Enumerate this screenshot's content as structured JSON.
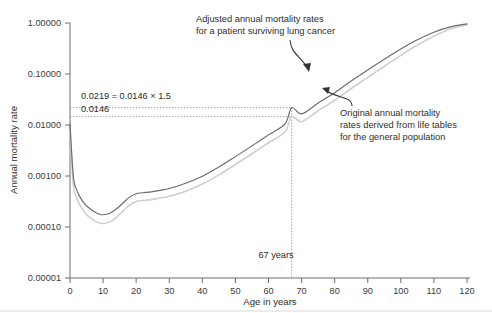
{
  "chart_data": {
    "type": "line",
    "title": "",
    "xlabel": "Age in years",
    "ylabel": "Annual mortality rate",
    "yscale": "log",
    "ylim": [
      1e-05,
      1.0
    ],
    "xlim": [
      0,
      120
    ],
    "grid": false,
    "legend_position": "none",
    "xticks": [
      "0",
      "10",
      "20",
      "30",
      "40",
      "50",
      "60",
      "70",
      "80",
      "90",
      "100",
      "110",
      "120"
    ],
    "xtick_values": [
      0,
      10,
      20,
      30,
      40,
      50,
      60,
      70,
      80,
      90,
      100,
      110,
      120
    ],
    "yticks": [
      "1.00000",
      "0.10000",
      "0.01000",
      "0.00100",
      "0.00010",
      "0.00001"
    ],
    "ytick_values": [
      1.0,
      0.1,
      0.01,
      0.001,
      0.0001,
      1e-05
    ],
    "x": [
      0,
      1,
      2,
      3,
      4,
      5,
      6,
      7,
      8,
      9,
      10,
      12,
      14,
      16,
      18,
      20,
      22,
      25,
      30,
      35,
      40,
      45,
      50,
      55,
      60,
      65,
      67,
      70,
      75,
      80,
      85,
      90,
      95,
      100,
      105,
      110,
      115,
      120
    ],
    "series": [
      {
        "name": "Adjusted annual mortality rates for a patient surviving lung cancer",
        "color": "#6b6b6b",
        "values": [
          0.0106,
          0.00099,
          0.00054,
          0.00039,
          0.00031,
          0.00026,
          0.00023,
          0.000205,
          0.000188,
          0.000178,
          0.000174,
          0.000186,
          0.000225,
          0.000295,
          0.000385,
          0.00045,
          0.00047,
          0.000495,
          0.00057,
          0.00072,
          0.00099,
          0.0015,
          0.0024,
          0.0039,
          0.0064,
          0.0105,
          0.0219,
          0.0165,
          0.027,
          0.043,
          0.073,
          0.12,
          0.195,
          0.31,
          0.47,
          0.66,
          0.84,
          0.96
        ]
      },
      {
        "name": "Original annual mortality rates derived from life tables for the general population",
        "color": "#cfcfcf",
        "values": [
          0.0076,
          0.00068,
          0.00037,
          0.00027,
          0.00021,
          0.000175,
          0.000155,
          0.000138,
          0.000126,
          0.00012,
          0.000117,
          0.000126,
          0.000155,
          0.000205,
          0.000268,
          0.000315,
          0.00033,
          0.000348,
          0.0004,
          0.000505,
          0.000695,
          0.00105,
          0.00168,
          0.00273,
          0.00448,
          0.00735,
          0.0146,
          0.0116,
          0.019,
          0.0305,
          0.052,
          0.086,
          0.142,
          0.232,
          0.37,
          0.55,
          0.76,
          0.92
        ]
      }
    ],
    "annotations": [
      {
        "name": "adjusted-curve-callout",
        "text_lines": [
          "Adjusted annual mortality rates",
          "for a patient surviving lung cancer"
        ],
        "points_to": "adjusted curve near age 72"
      },
      {
        "name": "original-curve-callout",
        "text_lines": [
          "Original annual mortality",
          "rates derived from life tables",
          "for the general population"
        ],
        "points_to": "original curve near age 75"
      },
      {
        "name": "ratio-label",
        "text": "0.0219 = 0.0146 × 1.5",
        "value": 0.0219
      },
      {
        "name": "baseline-label",
        "text": "0.0146",
        "value": 0.0146
      },
      {
        "name": "age-marker-label",
        "text": "67 years",
        "value": 67
      }
    ],
    "guides": {
      "horizontal_values": [
        0.0219,
        0.0146
      ],
      "vertical_value": 67
    }
  },
  "axis": {
    "x_title": "Age in years",
    "y_title": "Annual mortality rate"
  },
  "colors": {
    "adjusted_curve": "#6b6b6b",
    "original_curve": "#cfcfcf",
    "axis": "#6e6e6e",
    "guide": "#9a9a9a",
    "text": "#2e2e2e",
    "background": "#ffffff"
  }
}
